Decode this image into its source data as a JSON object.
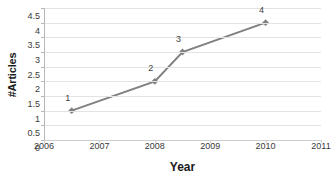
{
  "chart_data": {
    "type": "line",
    "title": "",
    "xlabel": "Year",
    "ylabel": "#Articles",
    "xlim": [
      2006,
      2011
    ],
    "ylim": [
      0,
      4.5
    ],
    "grid": true,
    "legend": false,
    "legend_position": "none",
    "series_color": "#808080",
    "marker": "diamond",
    "x": [
      2006.5,
      2008,
      2008.5,
      2010
    ],
    "values": [
      1,
      2,
      3,
      4
    ],
    "point_labels": [
      "1",
      "2",
      "3",
      "4"
    ],
    "xticks": [
      "2006",
      "2007",
      "2008",
      "2009",
      "2010",
      "2011"
    ],
    "xtick_values": [
      2006,
      2007,
      2008,
      2009,
      2010,
      2011
    ],
    "yticks": [
      "0",
      "0.5",
      "1",
      "1.5",
      "2",
      "2.5",
      "3",
      "3.5",
      "4",
      "4.5"
    ],
    "ytick_values": [
      0,
      0.5,
      1,
      1.5,
      2,
      2.5,
      3,
      3.5,
      4,
      4.5
    ]
  },
  "colors": {
    "background": "#ffffff",
    "gridline": "#e3e3e3",
    "axis": "#b8b8b8",
    "series": "#808080",
    "text": "#3a3a3a",
    "title_text": "#1a1a1a"
  }
}
